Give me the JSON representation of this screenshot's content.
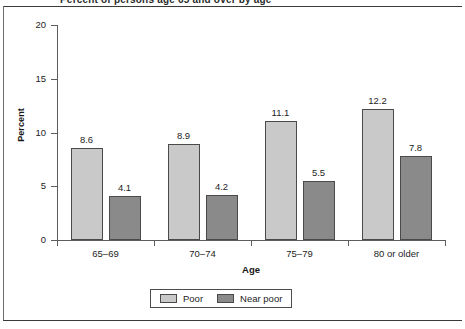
{
  "page": {
    "clipped_title": "Percent of persons age 65 and over by age"
  },
  "chart_data": {
    "type": "bar",
    "title": "",
    "xlabel": "Age",
    "ylabel": "Percent",
    "categories": [
      "65–69",
      "70–74",
      "75–79",
      "80 or older"
    ],
    "series": [
      {
        "name": "Poor",
        "color": "#c9c9c9",
        "values": [
          8.6,
          8.9,
          11.1,
          12.2
        ]
      },
      {
        "name": "Near poor",
        "color": "#8a8a8a",
        "values": [
          4.1,
          4.2,
          5.5,
          7.8
        ]
      }
    ],
    "value_labels": [
      [
        "8.6",
        "8.9",
        "11.1",
        "12.2"
      ],
      [
        "4.1",
        "4.2",
        "5.5",
        "7.8"
      ]
    ],
    "ylim": [
      0,
      20
    ],
    "yticks": [
      0,
      5,
      10,
      15,
      20
    ],
    "ytick_labels": [
      "0",
      "5",
      "10",
      "15",
      "20"
    ],
    "grid": false,
    "legend_position": "bottom-center",
    "legend": [
      "Poor",
      "Near poor"
    ]
  }
}
